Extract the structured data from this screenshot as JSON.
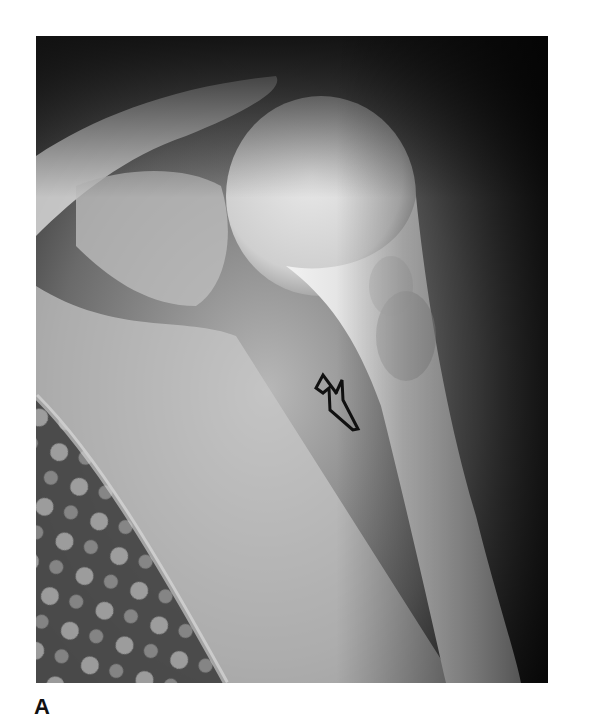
{
  "figure": {
    "type": "radiograph",
    "panel_label": "A",
    "annotation": {
      "type": "open-arrow",
      "pointing": "proximal humeral shaft lesion"
    },
    "colors": {
      "background": "#ffffff",
      "film_dark": "#1e1e1e",
      "bone_light": "#e6e6e6",
      "arrow_stroke": "#111111"
    }
  }
}
